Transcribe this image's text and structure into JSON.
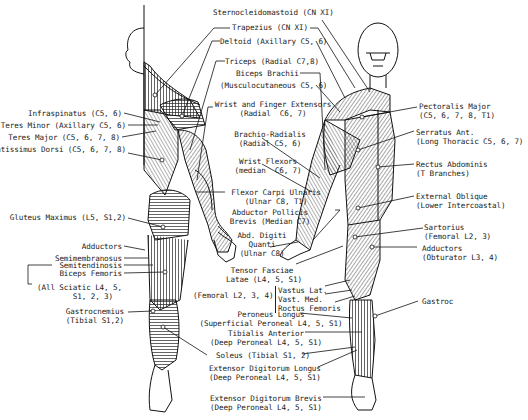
{
  "diagram": {
    "left_labels": [
      {
        "id": "infraspinatus",
        "text": "Infraspinatus (C5, 6)"
      },
      {
        "id": "teres-minor",
        "text": "Teres Minor (Axillary C5, 6)"
      },
      {
        "id": "teres-major",
        "text": "Teres Major (C5, 6, 7, 8)"
      },
      {
        "id": "latissimus",
        "text": "Latissimus Dorsi (C5, 6, 7, 8)"
      },
      {
        "id": "gluteus",
        "text": "Gluteus Maximus (L5, S1,2)"
      },
      {
        "id": "adductors-post",
        "text": "Adductors"
      },
      {
        "id": "semimembranosus",
        "text": "Semimembranosus"
      },
      {
        "id": "semitendinosis",
        "text": "Semitendinosis"
      },
      {
        "id": "biceps-femoris",
        "text": "Biceps Femoris"
      },
      {
        "id": "sciatic",
        "text": "(All Sciatic L4, 5,\n        S1, 2, 3)"
      },
      {
        "id": "gastrocnemius",
        "text": "Gastrocnemius\n(Tibial S1,2)"
      }
    ],
    "center_labels": [
      {
        "id": "sternocleidomastoid",
        "text": "Sternocleidomastoid (CN XI)"
      },
      {
        "id": "trapezius",
        "text": "Trapezius (CN XI)"
      },
      {
        "id": "deltoid",
        "text": "Deltoid (Axillary C5, 6)"
      },
      {
        "id": "triceps",
        "text": "Triceps (Radial C7,8)"
      },
      {
        "id": "biceps-brachii",
        "text": "Biceps Brachii"
      },
      {
        "id": "musculocutaneous",
        "text": "(Musculocutaneous C5, 6)"
      },
      {
        "id": "wrist-finger-ext",
        "text": "Wrist and Finger Extensors\n(Radial  C6, 7)"
      },
      {
        "id": "brachio-radialis",
        "text": "Brachio-Radialis\n(Radial C5, 6)"
      },
      {
        "id": "wrist-flexors",
        "text": "Wrist Flexors\n(median  C6, 7)"
      },
      {
        "id": "flexor-carpi-ulnaris",
        "text": "Flexor Carpi Ulnaris\n(Ulnar C8, T1)"
      },
      {
        "id": "abductor-pollicis",
        "text": "Abductor Pollicis\nBrevis (Median C7)"
      },
      {
        "id": "abd-digiti",
        "text": "Abd. Digiti\nQuanti\n(Ulnar C8)"
      },
      {
        "id": "tensor-fasciae",
        "text": "Tensor Fasciae\nLatae (L4, 5, S1)"
      },
      {
        "id": "femoral-quads",
        "text": "(Femoral L2, 3, 4)"
      },
      {
        "id": "quads",
        "text": "Vastus Lat.\nVast. Med.\nRoctus Femoris"
      },
      {
        "id": "peroneus-longus",
        "text": "Peroneus Longus\n(Superficial Peroneal L4, 5, S1)"
      },
      {
        "id": "tibialis-anterior",
        "text": "Tibialis Anterior\n(Deep Peroneal L4, 5, S1)"
      },
      {
        "id": "soleus",
        "text": "Soleus (Tibial S1, 2)"
      },
      {
        "id": "ext-dig-longus",
        "text": "Extensor Digitorum Longus\n(Deep Peroneal L4, 5, S1)"
      },
      {
        "id": "ext-dig-brevis",
        "text": "Extensor Digitorum Brevis\n(Deep Peroneal L4, 5, S1)"
      }
    ],
    "right_labels": [
      {
        "id": "pectoralis",
        "text": "Pectoralis Major\n(C5, 6, 7, 8, T1)"
      },
      {
        "id": "serratus",
        "text": "Serratus Ant.\n(Long Thoracic C5, 6, 7)"
      },
      {
        "id": "rectus-abdominis",
        "text": "Rectus Abdominis\n(T Branches)"
      },
      {
        "id": "external-oblique",
        "text": "External Oblique\n(Lower Intercoastal)"
      },
      {
        "id": "sartorius",
        "text": "Sartorius\n(Femoral L2, 3)"
      },
      {
        "id": "adductors-ant",
        "text": "Adductors\n(Obturator L3, 4)"
      },
      {
        "id": "gastroc",
        "text": "Gastroc"
      }
    ]
  }
}
